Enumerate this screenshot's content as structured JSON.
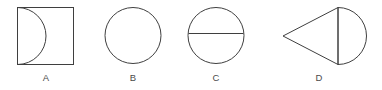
{
  "panel": {
    "background_color": "#ffffff",
    "stroke_color": "#3f3f3f",
    "label_color": "#4a4a4a"
  },
  "figures": [
    {
      "id": "figure-a",
      "label": "A",
      "shape_name": "square-with-semicircular-arc",
      "description": "Square with a semicircular arc springing from the top-left corner to the bottom-left corner, bulging rightward into the square",
      "geometry": {
        "square": {
          "x": 17,
          "y": 7,
          "width": 56,
          "height": 57
        },
        "arc": {
          "from": [
            17,
            7
          ],
          "to": [
            17,
            64
          ],
          "radius": 28.5,
          "bulge": "right"
        }
      }
    },
    {
      "id": "figure-b",
      "label": "B",
      "shape_name": "circle",
      "description": "Plain circle with no internal lines",
      "geometry": {
        "circle": {
          "cx": 133,
          "cy": 35,
          "r": 28
        }
      }
    },
    {
      "id": "figure-c",
      "label": "C",
      "shape_name": "circle-with-horizontal-chord",
      "description": "Circle divided by a horizontal chord drawn slightly above the centre",
      "geometry": {
        "circle": {
          "cx": 216,
          "cy": 35,
          "r": 28
        },
        "chord": {
          "x1": 188.4,
          "y1": 33,
          "x2": 243.6,
          "y2": 33
        }
      }
    },
    {
      "id": "figure-d",
      "label": "D",
      "shape_name": "triangle-with-semicircle",
      "description": "Left-pointing triangle joined to a right-hand semicircle along a shared vertical line",
      "geometry": {
        "triangle": {
          "apex": [
            283,
            36
          ],
          "top": [
            338,
            7
          ],
          "bottom": [
            338,
            64
          ]
        },
        "divider": {
          "x1": 338,
          "y1": 7,
          "x2": 338,
          "y2": 64
        },
        "semicircle": {
          "cx": 338,
          "cy": 35.5,
          "r": 28.5,
          "side": "right"
        }
      }
    }
  ]
}
